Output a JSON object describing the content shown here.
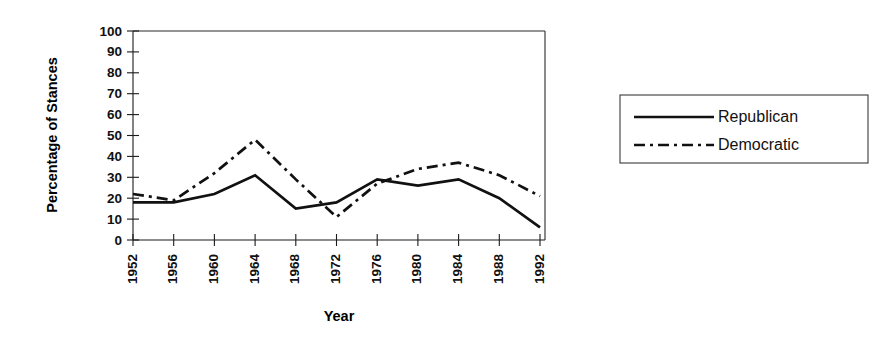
{
  "chart_data": {
    "type": "line",
    "title": "",
    "xlabel": "Year",
    "ylabel": "Percentage of Stances",
    "categories": [
      "1952",
      "1956",
      "1960",
      "1964",
      "1968",
      "1972",
      "1976",
      "1980",
      "1984",
      "1988",
      "1992"
    ],
    "x": [
      1952,
      1956,
      1960,
      1964,
      1968,
      1972,
      1976,
      1980,
      1984,
      1988,
      1992
    ],
    "series": [
      {
        "name": "Republican",
        "style": "solid",
        "color": "#111111",
        "values": [
          18,
          18,
          22,
          31,
          15,
          18,
          29,
          26,
          29,
          20,
          6
        ]
      },
      {
        "name": "Democratic",
        "style": "dash-dot",
        "color": "#111111",
        "values": [
          22,
          19,
          32,
          48,
          29,
          11,
          27,
          34,
          37,
          31,
          21
        ]
      }
    ],
    "ylim": [
      0,
      100
    ],
    "yticks": [
      0,
      10,
      20,
      30,
      40,
      50,
      60,
      70,
      80,
      90,
      100
    ],
    "ytick_labels": [
      "0",
      "10",
      "20",
      "30",
      "40",
      "50",
      "60",
      "70",
      "80",
      "90",
      "100"
    ],
    "grid": false,
    "legend_position": "right",
    "legend_entries": [
      "Republican",
      "Democratic"
    ],
    "xtick_rotation": 90
  },
  "axis": {
    "y_title": "Percentage of Stances",
    "x_title": "Year"
  },
  "legend": {
    "republican_label": "Republican",
    "democratic_label": "Democratic"
  }
}
